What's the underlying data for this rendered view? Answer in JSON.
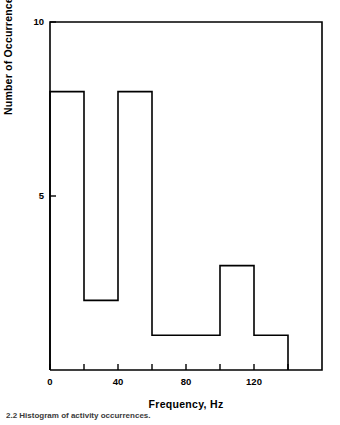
{
  "chart_data": {
    "type": "bar",
    "title": "",
    "subtitle": "",
    "xlabel": "Frequency, Hz",
    "ylabel": "Number of Occurrences",
    "xlim": [
      0,
      160
    ],
    "ylim": [
      0,
      10
    ],
    "grid": false,
    "legend": null,
    "x_major_ticks": [
      0,
      40,
      80,
      120
    ],
    "x_major_tick_labels": [
      "0",
      "40",
      "80",
      "120"
    ],
    "x_minor_ticks": [
      20,
      60,
      100,
      140
    ],
    "y_major_ticks": [
      5,
      10
    ],
    "y_major_tick_labels": [
      "5",
      "10"
    ],
    "bin_edges": [
      0,
      20,
      40,
      60,
      80,
      100,
      120,
      140
    ],
    "categories": [
      "0-20",
      "20-40",
      "40-60",
      "60-80",
      "80-100",
      "100-120",
      "120-140"
    ],
    "values": [
      8,
      2,
      8,
      1,
      1,
      3,
      1
    ],
    "bar_style": "step-outline",
    "line_color": "#000000",
    "fill_color": "none",
    "background_color": "#ffffff"
  },
  "figure": {
    "caption": "2.2   Histogram of activity occurrences."
  },
  "axis": {
    "y_label": "Number of Occurrences",
    "x_label": "Frequency, Hz",
    "y_tick_10": "10",
    "y_tick_5": "5",
    "x_tick_0": "0",
    "x_tick_40": "40",
    "x_tick_80": "80",
    "x_tick_120": "120"
  }
}
